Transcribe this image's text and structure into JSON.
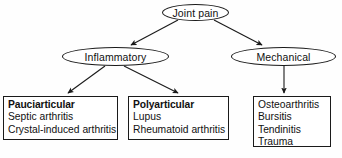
{
  "diagram": {
    "stroke_color": "#1a1a1a",
    "text_color": "#111111",
    "background_color": "#fefefe",
    "root": {
      "label": "Joint pain"
    },
    "branches": [
      {
        "label": "Inflammatory"
      },
      {
        "label": "Mechanical"
      }
    ],
    "boxes": [
      {
        "heading": "Pauciarticular",
        "items": [
          "Septic arthritis",
          "Crystal-induced arthritis"
        ]
      },
      {
        "heading": "Polyarticular",
        "items": [
          "Lupus",
          "Rheumatoid arthritis"
        ]
      },
      {
        "heading": "",
        "items": [
          "Osteoarthritis",
          "Bursitis",
          "Tendinitis",
          "Trauma"
        ]
      }
    ]
  }
}
